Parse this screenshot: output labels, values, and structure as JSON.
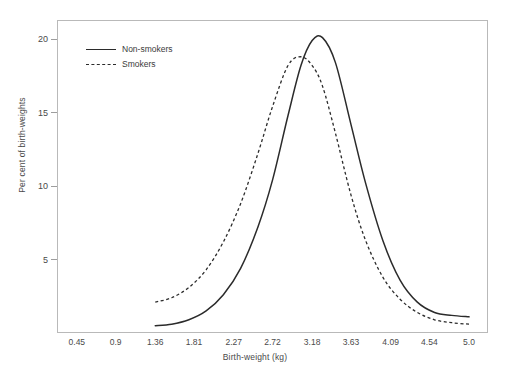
{
  "chart_data": {
    "type": "line",
    "title": "",
    "xlabel": "Birth-weight (kg)",
    "ylabel": "Per cent of birth-weights",
    "x_ticks": [
      "0.45",
      "0.9",
      "1.36",
      "1.81",
      "2.27",
      "2.72",
      "3.18",
      "3.63",
      "4.09",
      "4.54",
      "5.0"
    ],
    "x_tick_values": [
      0.45,
      0.9,
      1.36,
      1.81,
      2.27,
      2.72,
      3.18,
      3.63,
      4.09,
      4.54,
      5.0
    ],
    "y_ticks": [
      "5",
      "10",
      "15",
      "20"
    ],
    "y_tick_values": [
      5,
      10,
      15,
      20
    ],
    "xlim": [
      0.22,
      5.22
    ],
    "ylim": [
      0,
      21.3
    ],
    "grid": false,
    "legend_position": "top-left",
    "x": [
      1.36,
      1.55,
      1.75,
      1.95,
      2.15,
      2.35,
      2.55,
      2.72,
      2.9,
      3.05,
      3.18,
      3.3,
      3.45,
      3.63,
      3.8,
      4.0,
      4.2,
      4.4,
      4.6,
      4.8,
      5.0
    ],
    "series": [
      {
        "name": "Non-smokers",
        "style": "solid",
        "color": "#2b2b2b",
        "values": [
          0.5,
          0.6,
          0.9,
          1.5,
          2.6,
          4.4,
          7.2,
          10.4,
          14.8,
          18.2,
          19.9,
          20.1,
          18.4,
          14.2,
          10.2,
          6.3,
          3.6,
          2.1,
          1.4,
          1.2,
          1.1
        ]
      },
      {
        "name": "Smokers",
        "style": "dashed",
        "color": "#2b2b2b",
        "values": [
          2.1,
          2.4,
          3.1,
          4.3,
          6.2,
          8.8,
          12.2,
          15.4,
          18.2,
          18.8,
          18.2,
          16.8,
          13.6,
          9.4,
          6.3,
          3.8,
          2.3,
          1.4,
          0.9,
          0.7,
          0.6
        ]
      }
    ],
    "peaks": [
      {
        "series": "Non-smokers",
        "x": 3.25,
        "y": 20.1
      },
      {
        "series": "Smokers",
        "x": 3.0,
        "y": 18.8
      }
    ]
  },
  "legend": {
    "items": [
      {
        "label": "Non-smokers",
        "style": "solid"
      },
      {
        "label": "Smokers",
        "style": "dashed"
      }
    ]
  },
  "colors": {
    "background": "#ffffff",
    "frame": "#b9b9b9",
    "curve": "#2b2b2b",
    "text": "#3a3a3a",
    "tick": "#9d9d9d"
  }
}
